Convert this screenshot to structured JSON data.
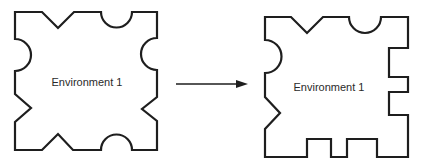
{
  "diagram": {
    "type": "transformation",
    "source": {
      "label": "Environment 1",
      "edges": {
        "top": [
          "v-notch",
          "semicircle-notch"
        ],
        "right": [
          "semicircle-notch",
          "v-notch"
        ],
        "bottom": [
          "v-bump",
          "semicircle-bump"
        ],
        "left": [
          "semicircle-bump",
          "v-notch"
        ]
      }
    },
    "target": {
      "label": "Environment 1",
      "edges": {
        "top": [
          "v-notch",
          "semicircle-notch"
        ],
        "right": [
          "square-notch",
          "square-notch"
        ],
        "bottom": [
          "square-bump",
          "square-bump"
        ],
        "left": [
          "semicircle-bump",
          "v-notch"
        ]
      }
    },
    "arrow": {
      "direction": "right",
      "from": "source",
      "to": "target"
    }
  }
}
